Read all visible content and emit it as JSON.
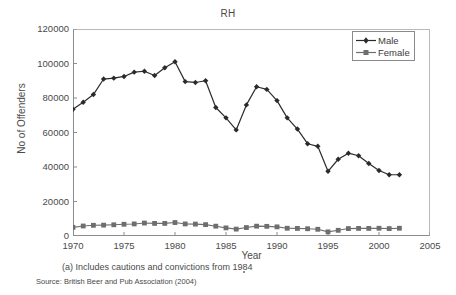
{
  "chart_data": {
    "type": "line",
    "title": "RH",
    "xlabel": "Year",
    "ylabel": "No of Offenders",
    "xlim": [
      1970,
      2005
    ],
    "ylim": [
      0,
      120000
    ],
    "xticks": [
      1970,
      1975,
      1980,
      1985,
      1990,
      1995,
      2000,
      2005
    ],
    "yticks": [
      0,
      20000,
      40000,
      60000,
      80000,
      100000,
      120000
    ],
    "grid": false,
    "legend_position": "top-right",
    "x": [
      1970,
      1971,
      1972,
      1973,
      1974,
      1975,
      1976,
      1977,
      1978,
      1979,
      1980,
      1981,
      1982,
      1983,
      1984,
      1985,
      1986,
      1987,
      1988,
      1989,
      1990,
      1991,
      1992,
      1993,
      1994,
      1995,
      1996,
      1997,
      1998,
      1999,
      2000,
      2001,
      2002
    ],
    "series": [
      {
        "name": "Male",
        "marker": "diamond",
        "color": "#2b2b2b",
        "values": [
          73500,
          77500,
          82000,
          91000,
          91500,
          92500,
          95000,
          95500,
          93000,
          97500,
          101000,
          89500,
          89000,
          90000,
          74500,
          68500,
          61500,
          76000,
          86500,
          85000,
          78500,
          68500,
          62000,
          53500,
          52000,
          37500,
          44500,
          48000,
          46500,
          42000,
          38000,
          35500,
          35500
        ]
      },
      {
        "name": "Female",
        "marker": "square",
        "color": "#6e6e6e",
        "values": [
          5000,
          5800,
          6200,
          6300,
          6500,
          6800,
          7000,
          7500,
          7300,
          7300,
          7800,
          7000,
          6900,
          6600,
          5700,
          4700,
          4000,
          4900,
          5700,
          5600,
          5300,
          4500,
          4400,
          4200,
          3900,
          2400,
          3300,
          4300,
          4400,
          4400,
          4500,
          4300,
          4500
        ]
      }
    ],
    "footnote": "(a) Includes cautions and convictions from 1984",
    "source": "Source: British Beer and Pub Association (2004)"
  },
  "legend": {
    "items": [
      {
        "label": "Male"
      },
      {
        "label": "Female"
      }
    ]
  }
}
